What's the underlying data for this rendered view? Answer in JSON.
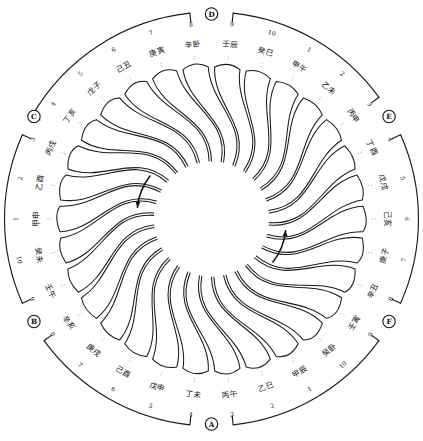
{
  "figure": {
    "petal_count": 30,
    "inner_circle_label": "",
    "stroke_color": "#1b1b1b",
    "background_color": "#ffffff"
  },
  "markers": [
    {
      "id": "A",
      "label": "A",
      "position": "left",
      "angle_deg": 180
    },
    {
      "id": "B",
      "label": "B",
      "position": "top-left",
      "angle_deg": 240
    },
    {
      "id": "C",
      "label": "C",
      "position": "top-right",
      "angle_deg": 300
    },
    {
      "id": "D",
      "label": "D",
      "position": "right",
      "angle_deg": 0
    },
    {
      "id": "E",
      "label": "E",
      "position": "bottom-right",
      "angle_deg": 60
    },
    {
      "id": "F",
      "label": "F",
      "position": "bottom-left",
      "angle_deg": 120
    }
  ],
  "brackets": [
    {
      "name": "bracket-top",
      "start_angle_deg": 246,
      "end_angle_deg": 294
    },
    {
      "name": "bracket-upper-right",
      "start_angle_deg": 300,
      "end_angle_deg": 354
    },
    {
      "name": "bracket-lower-right",
      "start_angle_deg": 6,
      "end_angle_deg": 54
    },
    {
      "name": "bracket-bottom",
      "start_angle_deg": 66,
      "end_angle_deg": 114
    },
    {
      "name": "bracket-lower-left",
      "start_angle_deg": 126,
      "end_angle_deg": 174
    },
    {
      "name": "bracket-upper-left",
      "start_angle_deg": 186,
      "end_angle_deg": 234
    }
  ],
  "arrows": [
    {
      "name": "arrow-upper-right",
      "angle_deg": 305,
      "direction": "counterclockwise"
    },
    {
      "name": "arrow-lower-left",
      "angle_deg": 125,
      "direction": "counterclockwise"
    }
  ],
  "labels": [
    {
      "index": 1,
      "num": "1",
      "cjk": "甲申",
      "angle_deg": 270
    },
    {
      "index": 2,
      "num": "2",
      "cjk": "乙酉",
      "angle_deg": 282
    },
    {
      "index": 3,
      "num": "3",
      "cjk": "丙戌",
      "angle_deg": 294
    },
    {
      "index": 4,
      "num": "4",
      "cjk": "丁亥",
      "angle_deg": 306
    },
    {
      "index": 5,
      "num": "5",
      "cjk": "戊子",
      "angle_deg": 318
    },
    {
      "index": 6,
      "num": "6",
      "cjk": "己丑",
      "angle_deg": 330
    },
    {
      "index": 7,
      "num": "7",
      "cjk": "庚寅",
      "angle_deg": 342
    },
    {
      "index": 8,
      "num": "8",
      "cjk": "辛卧",
      "angle_deg": 354
    },
    {
      "index": 9,
      "num": "9",
      "cjk": "壬辰",
      "angle_deg": 6
    },
    {
      "index": 10,
      "num": "10",
      "cjk": "癸巳",
      "angle_deg": 18
    },
    {
      "index": 11,
      "num": "1",
      "cjk": "甲午",
      "angle_deg": 30
    },
    {
      "index": 12,
      "num": "2",
      "cjk": "乙未",
      "angle_deg": 42
    },
    {
      "index": 13,
      "num": "3",
      "cjk": "丙申",
      "angle_deg": 54
    },
    {
      "index": 14,
      "num": "4",
      "cjk": "丁酉",
      "angle_deg": 66
    },
    {
      "index": 15,
      "num": "5",
      "cjk": "戊戌",
      "angle_deg": 78
    },
    {
      "index": 16,
      "num": "6",
      "cjk": "己亥",
      "angle_deg": 90
    },
    {
      "index": 17,
      "num": "7",
      "cjk": "庚子",
      "angle_deg": 102
    },
    {
      "index": 18,
      "num": "8",
      "cjk": "辛丑",
      "angle_deg": 114
    },
    {
      "index": 19,
      "num": "9",
      "cjk": "壬寅",
      "angle_deg": 126
    },
    {
      "index": 20,
      "num": "10",
      "cjk": "癸卧",
      "angle_deg": 138
    },
    {
      "index": 21,
      "num": "1",
      "cjk": "甲辰",
      "angle_deg": 150
    },
    {
      "index": 22,
      "num": "2",
      "cjk": "乙巳",
      "angle_deg": 162
    },
    {
      "index": 23,
      "num": "3",
      "cjk": "丙午",
      "angle_deg": 174
    },
    {
      "index": 24,
      "num": "4",
      "cjk": "丁未",
      "angle_deg": 186
    },
    {
      "index": 25,
      "num": "5",
      "cjk": "戊申",
      "angle_deg": 198
    },
    {
      "index": 26,
      "num": "6",
      "cjk": "己酉",
      "angle_deg": 210
    },
    {
      "index": 27,
      "num": "7",
      "cjk": "庚戌",
      "angle_deg": 222
    },
    {
      "index": 28,
      "num": "8",
      "cjk": "辛亥",
      "angle_deg": 234
    },
    {
      "index": 29,
      "num": "9",
      "cjk": "壬午",
      "angle_deg": 246
    },
    {
      "index": 30,
      "num": "10",
      "cjk": "癸未",
      "angle_deg": 258
    }
  ]
}
